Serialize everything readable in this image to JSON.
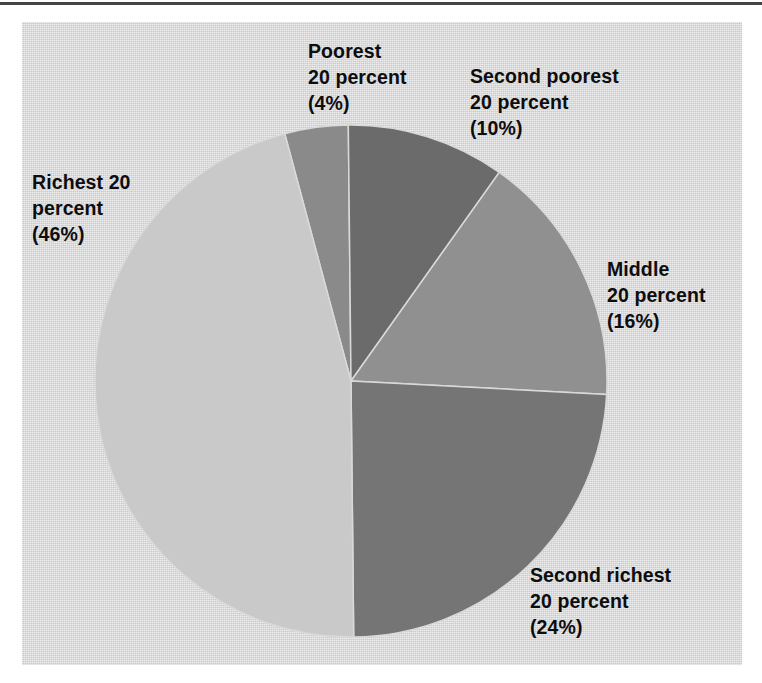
{
  "figure": {
    "background_color": "#d9d9d9",
    "page_color": "#ffffff",
    "rule_color": "#2a2a2a"
  },
  "chart_data": {
    "type": "pie",
    "title": "",
    "subtitle": "",
    "xlabel": "",
    "ylabel": "",
    "grid": false,
    "legend_position": "none",
    "labels_placement": "outside-callout-free",
    "center": {
      "x": 351,
      "y": 381
    },
    "radius": 256,
    "start_angle_deg": -15,
    "direction": "clockwise",
    "units": "percent",
    "total": 100,
    "categories": [
      "Poorest 20 percent",
      "Second poorest 20 percent",
      "Middle 20 percent",
      "Second richest 20 percent",
      "Richest 20 percent"
    ],
    "values": [
      4,
      10,
      16,
      24,
      46
    ],
    "colors": [
      "#8a8a8a",
      "#6b6b6b",
      "#909090",
      "#757575",
      "#c9c9c9"
    ],
    "slices": [
      {
        "name": "Poorest 20 percent",
        "value": 4,
        "display": "(4%)",
        "color": "#8a8a8a"
      },
      {
        "name": "Second poorest 20 percent",
        "value": 10,
        "display": "(10%)",
        "color": "#6b6b6b"
      },
      {
        "name": "Middle 20 percent",
        "value": 16,
        "display": "(16%)",
        "color": "#909090"
      },
      {
        "name": "Second richest 20 percent",
        "value": 24,
        "display": "(24%)",
        "color": "#757575"
      },
      {
        "name": "Richest 20 percent",
        "value": 46,
        "display": "(46%)",
        "color": "#c9c9c9"
      }
    ]
  },
  "labels": {
    "poorest": {
      "line1": "Poorest",
      "line2": "20 percent",
      "line3": "(4%)"
    },
    "second_poorest": {
      "line1": "Second poorest",
      "line2": "20 percent",
      "line3": "(10%)"
    },
    "middle": {
      "line1": "Middle",
      "line2": "20 percent",
      "line3": "(16%)"
    },
    "second_richest": {
      "line1": "Second richest",
      "line2": "20 percent",
      "line3": "(24%)"
    },
    "richest": {
      "line1": "Richest 20",
      "line2": "percent",
      "line3": "(46%)"
    }
  }
}
